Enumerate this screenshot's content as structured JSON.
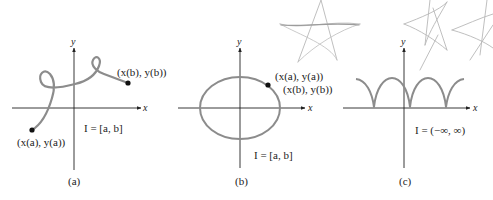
{
  "figure": {
    "panels": [
      {
        "id": "a",
        "caption": "(a)",
        "x_axis_label": "x",
        "y_axis_label": "y",
        "start_point_label": "(x(a), y(a))",
        "end_point_label": "(x(b), y(b))",
        "interval_label": "I = [a, b]",
        "curve_description": "open curve with two loops from start point to end point"
      },
      {
        "id": "b",
        "caption": "(b)",
        "x_axis_label": "x",
        "y_axis_label": "y",
        "start_point_label": "(x(a), y(a))",
        "end_point_label": "(x(b), y(b))",
        "interval_label": "I = [a, b]",
        "curve_description": "closed ellipse; start and end points coincide"
      },
      {
        "id": "c",
        "caption": "(c)",
        "x_axis_label": "x",
        "y_axis_label": "y",
        "interval_label": "I = (−∞, ∞)",
        "curve_description": "periodic cycloid-like arches with cusps on the x-axis"
      }
    ],
    "colors": {
      "curve": "#8c8c8c",
      "axes": "#222222",
      "points": "#111111",
      "scribble": "#b5b5b5",
      "background": "#ffffff"
    },
    "decorations": {
      "star_scribbles_count": 3
    }
  }
}
